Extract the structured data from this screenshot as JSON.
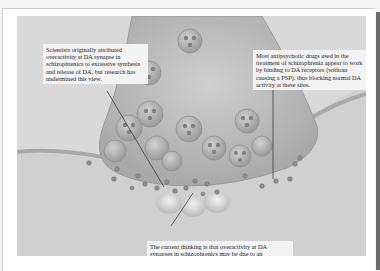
{
  "figure": {
    "colors": {
      "background": "#d9d9d9",
      "terminal": "#b8b8b8",
      "vesicle": "#9c9c9c",
      "da_molecule": "#8a8a8a",
      "membrane": "#a6a6a6",
      "callout_bg": "#f3f3f3"
    }
  },
  "callouts": [
    {
      "id": "original-hypothesis",
      "text": "Scientists originally attributed overactivity at DA synapse in schizophrenics to excessive synthesis and release of DA, but research has undermined this view."
    },
    {
      "id": "antipsychotic-action",
      "text": "Most antipsychotic drugs used in the treatment of schizophrenia appear to work by binding to DA receptors (without causing a PSP), thus blocking normal DA activity at these sites."
    },
    {
      "id": "current-thinking",
      "text": "The current thinking is that overactivity at DA synapses in schizophrenics may be due to an overabundance of postsynaptic DA receptor sites."
    }
  ]
}
